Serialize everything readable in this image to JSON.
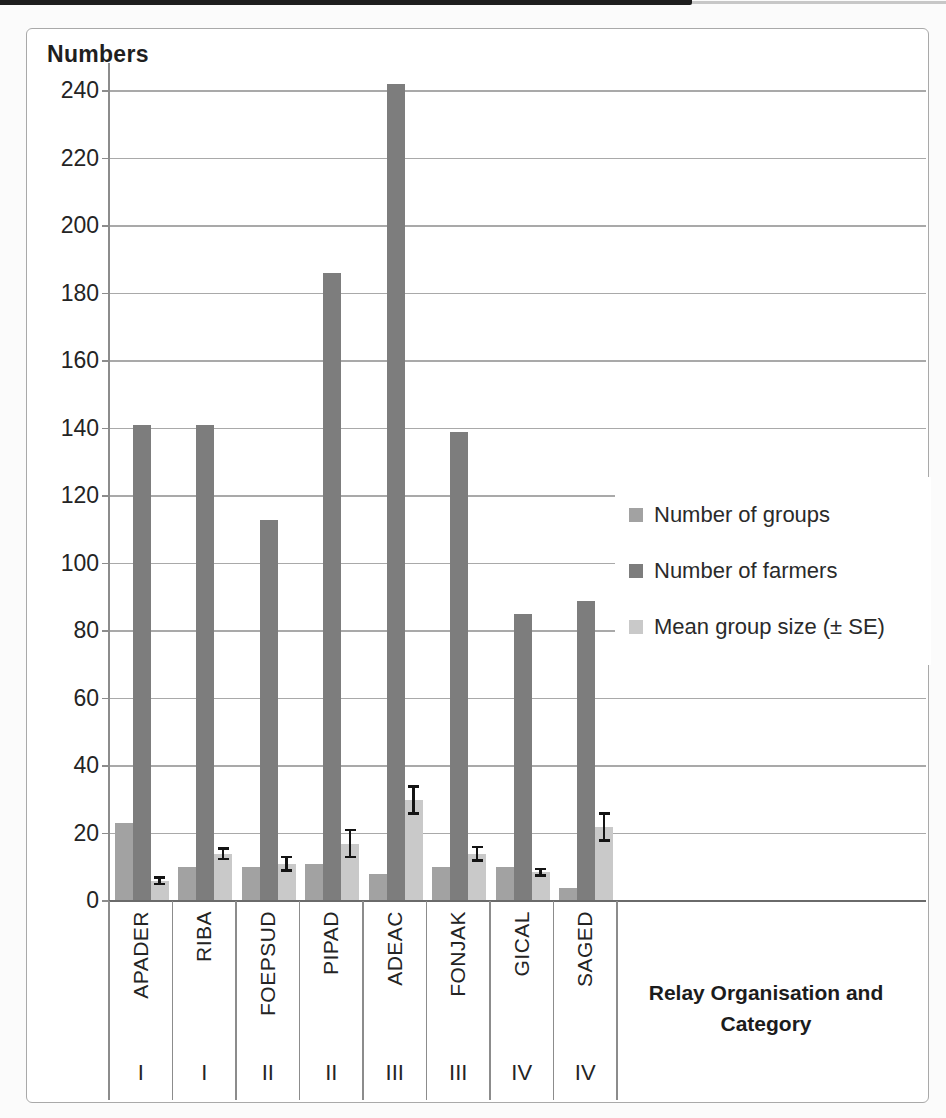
{
  "chart_data": {
    "type": "bar",
    "title": "Numbers",
    "x_axis_title": "Relay Organisation and Category",
    "x_axis_title_lines": [
      "Relay Organisation and",
      "Category"
    ],
    "categories": [
      "APADER",
      "RIBA",
      "FOEPSUD",
      "PIPAD",
      "ADEAC",
      "FONJAK",
      "GICAL",
      "SAGED"
    ],
    "category_groups": [
      "I",
      "I",
      "II",
      "II",
      "III",
      "III",
      "IV",
      "IV"
    ],
    "series": [
      {
        "name": "Number of groups",
        "color": "#a2a2a2",
        "values": [
          23,
          10,
          10,
          11,
          8,
          10,
          10,
          4
        ]
      },
      {
        "name": "Number of farmers",
        "color": "#7d7d7d",
        "values": [
          141,
          141,
          113,
          186,
          242,
          139,
          85,
          89
        ]
      },
      {
        "name": "Mean group size (± SE)",
        "color": "#c9c9c9",
        "values": [
          6,
          14,
          11,
          17,
          30,
          14,
          8.5,
          22
        ],
        "error": [
          1,
          1.5,
          2,
          4,
          4,
          2,
          1,
          4
        ]
      }
    ],
    "yticks": [
      0,
      20,
      40,
      60,
      80,
      100,
      120,
      140,
      160,
      180,
      200,
      220,
      240
    ],
    "ylim": [
      0,
      240
    ],
    "grid": true,
    "legend_position": "right-middle",
    "styles": {
      "gridline_color": "#a9a9a9",
      "axis_line_color": "#8c8c8c",
      "baseline_color": "#6a6a6a",
      "frame_border_color": "#a9a9a9",
      "error_bar_color": "#141414",
      "text_color": "#242424"
    }
  }
}
